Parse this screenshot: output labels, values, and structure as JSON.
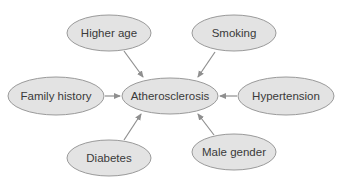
{
  "diagram": {
    "type": "causal-factor-diagram",
    "center": {
      "id": "atherosclerosis",
      "label": "Atherosclerosis"
    },
    "nodes": [
      {
        "id": "higher_age",
        "label": "Higher age"
      },
      {
        "id": "smoking",
        "label": "Smoking"
      },
      {
        "id": "family_history",
        "label": "Family history"
      },
      {
        "id": "atherosclerosis",
        "label": "Atherosclerosis"
      },
      {
        "id": "hypertension",
        "label": "Hypertension"
      },
      {
        "id": "diabetes",
        "label": "Diabetes"
      },
      {
        "id": "male_gender",
        "label": "Male gender"
      }
    ],
    "edges": [
      {
        "from": "higher_age",
        "to": "atherosclerosis"
      },
      {
        "from": "smoking",
        "to": "atherosclerosis"
      },
      {
        "from": "family_history",
        "to": "atherosclerosis"
      },
      {
        "from": "hypertension",
        "to": "atherosclerosis"
      },
      {
        "from": "diabetes",
        "to": "atherosclerosis"
      },
      {
        "from": "male_gender",
        "to": "atherosclerosis"
      }
    ],
    "colors": {
      "node_fill": "#e3e3e3",
      "node_stroke": "#9a9a9a",
      "edge": "#8f8f8f",
      "text": "#3a3a3a"
    }
  }
}
